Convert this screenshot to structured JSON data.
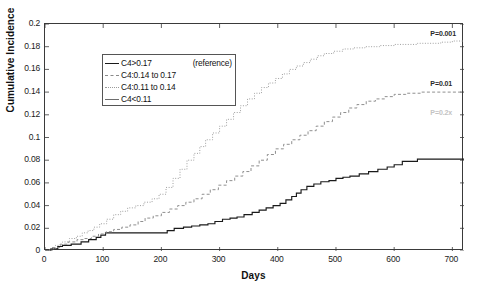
{
  "chart_data": {
    "type": "line",
    "title": "",
    "xlabel": "Days",
    "ylabel": "Cumulative Incidence",
    "xlim": [
      0,
      720
    ],
    "ylim": [
      0,
      0.2
    ],
    "xticks": [
      "0",
      "100",
      "200",
      "300",
      "400",
      "500",
      "600",
      "700"
    ],
    "xtick_values": [
      0,
      100,
      200,
      300,
      400,
      500,
      600,
      700
    ],
    "yticks": [
      "0",
      "0.02",
      "0.04",
      "0.06",
      "0.08",
      "0.1",
      "0.12",
      "0.14",
      "0.16",
      "0.18",
      "0.2"
    ],
    "ytick_values": [
      0,
      0.02,
      0.04,
      0.06,
      0.08,
      0.1,
      0.12,
      0.14,
      0.16,
      0.18,
      0.2
    ],
    "grid": false,
    "legend_position": "top-left",
    "step_type": "post",
    "series": [
      {
        "name": "C4>0.17",
        "note": "(reference)",
        "style": "solid",
        "color": "#1a1a1a",
        "final_value": 0.081,
        "x": [
          0,
          10,
          22,
          30,
          45,
          62,
          75,
          88,
          96,
          104,
          120,
          132,
          150,
          165,
          175,
          196,
          210,
          222,
          238,
          252,
          266,
          280,
          292,
          305,
          318,
          330,
          342,
          356,
          368,
          380,
          392,
          404,
          414,
          424,
          432,
          440,
          450,
          462,
          474,
          488,
          500,
          512,
          524,
          540,
          556,
          572,
          588,
          600,
          614,
          640,
          672,
          700,
          720
        ],
        "y": [
          0,
          0.002,
          0.004,
          0.005,
          0.006,
          0.008,
          0.01,
          0.012,
          0.014,
          0.016,
          0.016,
          0.016,
          0.016,
          0.016,
          0.016,
          0.016,
          0.018,
          0.02,
          0.021,
          0.022,
          0.023,
          0.024,
          0.026,
          0.028,
          0.029,
          0.03,
          0.032,
          0.034,
          0.036,
          0.038,
          0.04,
          0.042,
          0.045,
          0.048,
          0.051,
          0.054,
          0.057,
          0.059,
          0.061,
          0.062,
          0.064,
          0.065,
          0.066,
          0.068,
          0.07,
          0.072,
          0.074,
          0.076,
          0.079,
          0.081,
          0.081,
          0.081,
          0.081
        ]
      },
      {
        "name": "C4:0.14 to 0.17",
        "note": "",
        "style": "dashed",
        "color": "#8f8f8f",
        "final_value": 0.14,
        "x": [
          0,
          12,
          26,
          40,
          55,
          68,
          80,
          92,
          105,
          118,
          132,
          146,
          160,
          172,
          186,
          200,
          214,
          228,
          242,
          256,
          270,
          284,
          298,
          312,
          326,
          340,
          354,
          368,
          382,
          396,
          410,
          424,
          438,
          452,
          466,
          480,
          494,
          508,
          522,
          536,
          552,
          568,
          584,
          600,
          620,
          645,
          670,
          700,
          720
        ],
        "y": [
          0,
          0.003,
          0.006,
          0.008,
          0.01,
          0.011,
          0.013,
          0.015,
          0.017,
          0.019,
          0.021,
          0.023,
          0.026,
          0.029,
          0.031,
          0.034,
          0.037,
          0.04,
          0.043,
          0.046,
          0.05,
          0.054,
          0.058,
          0.062,
          0.066,
          0.07,
          0.075,
          0.08,
          0.085,
          0.09,
          0.094,
          0.098,
          0.102,
          0.106,
          0.11,
          0.114,
          0.118,
          0.122,
          0.126,
          0.129,
          0.132,
          0.134,
          0.136,
          0.138,
          0.139,
          0.14,
          0.14,
          0.14,
          0.14
        ]
      },
      {
        "name": "C4:0.11 to 0.14",
        "note": "",
        "style": "dotted",
        "color": "#a0a0a0",
        "final_value": 0.185,
        "x": [
          0,
          8,
          18,
          30,
          42,
          54,
          64,
          74,
          84,
          94,
          106,
          118,
          130,
          142,
          156,
          170,
          184,
          196,
          208,
          220,
          232,
          244,
          256,
          266,
          276,
          288,
          300,
          312,
          324,
          336,
          348,
          360,
          372,
          384,
          396,
          408,
          420,
          432,
          444,
          456,
          468,
          480,
          496,
          512,
          530,
          550,
          575,
          600,
          640,
          680,
          700,
          720
        ],
        "y": [
          0,
          0.002,
          0.005,
          0.008,
          0.011,
          0.013,
          0.016,
          0.018,
          0.021,
          0.024,
          0.028,
          0.032,
          0.035,
          0.038,
          0.04,
          0.043,
          0.046,
          0.05,
          0.056,
          0.064,
          0.072,
          0.08,
          0.086,
          0.092,
          0.098,
          0.104,
          0.11,
          0.116,
          0.122,
          0.128,
          0.134,
          0.139,
          0.144,
          0.148,
          0.152,
          0.156,
          0.16,
          0.163,
          0.166,
          0.169,
          0.172,
          0.174,
          0.176,
          0.178,
          0.179,
          0.18,
          0.181,
          0.182,
          0.183,
          0.184,
          0.185,
          0.185
        ]
      },
      {
        "name": "C4<0.11",
        "note": "",
        "style": "solid-gray",
        "color": "#6d6d6d",
        "final_value": 0.115,
        "x": [
          0,
          720
        ],
        "y": [
          0,
          0
        ]
      }
    ],
    "annotations": [
      {
        "text": "P=0.001",
        "x": 700,
        "y": 0.187,
        "faint": false
      },
      {
        "text": "P=0.01",
        "x": 700,
        "y": 0.143,
        "faint": false
      },
      {
        "text": "P=0.2x",
        "x": 700,
        "y": 0.117,
        "faint": true
      }
    ]
  },
  "legend": {
    "items": [
      {
        "label": "C4>0.17",
        "note": "(reference)",
        "style": "ls-solid"
      },
      {
        "label": "C4:0.14 to 0.17",
        "note": "",
        "style": "ls-dash"
      },
      {
        "label": "C4:0.11 to 0.14",
        "note": "",
        "style": "ls-dot"
      },
      {
        "label": "C4<0.11",
        "note": "",
        "style": "ls-solid2"
      }
    ]
  }
}
